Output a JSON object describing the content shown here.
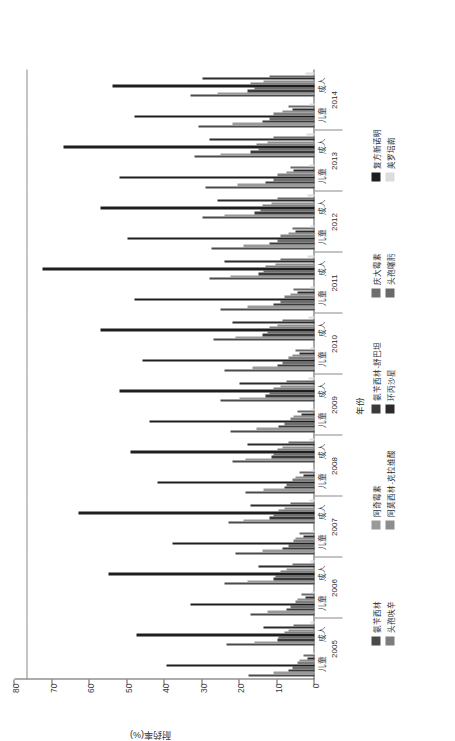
{
  "chart_data": {
    "type": "bar",
    "title": "",
    "orientation": "vertical-grouped",
    "xlabel": "年份",
    "ylabel": "耐药率(%)",
    "ylim": [
      0,
      80
    ],
    "yticks": [
      0,
      10,
      20,
      30,
      40,
      50,
      60,
      70,
      80
    ],
    "ytick_labels": [
      "0",
      "10",
      "20",
      "30",
      "40",
      "50",
      "60",
      "70",
      "80"
    ],
    "grid": false,
    "legend_position": "bottom",
    "categories": [
      "2005 儿童",
      "2005 成人",
      "2006 儿童",
      "2006 成人",
      "2007 儿童",
      "2007 成人",
      "2008 儿童",
      "2008 成人",
      "2009 儿童",
      "2009 成人",
      "2010 儿童",
      "2010 成人",
      "2011 儿童",
      "2011 成人",
      "2012 儿童",
      "2012 成人",
      "2013 儿童",
      "2013 成人",
      "2014 儿童",
      "2014 成人"
    ],
    "years": [
      "2005",
      "2006",
      "2007",
      "2008",
      "2009",
      "2010",
      "2011",
      "2012",
      "2013",
      "2014"
    ],
    "subgroups": [
      "儿童",
      "成人"
    ],
    "series": [
      {
        "name": "氨苄西林",
        "color": "#4a4a4a",
        "values": [
          17.5,
          23.5,
          17.0,
          24.0,
          21.0,
          23.0,
          18.5,
          22.0,
          22.5,
          25.0,
          24.0,
          27.0,
          25.0,
          28.0,
          27.5,
          30.0,
          29.0,
          32.0,
          31.0,
          33.0
        ]
      },
      {
        "name": "阿奇霉素",
        "color": "#9a9a9a",
        "values": [
          11.0,
          16.0,
          12.5,
          18.0,
          14.0,
          19.0,
          13.5,
          18.5,
          15.5,
          20.0,
          16.5,
          21.0,
          18.0,
          22.5,
          19.0,
          24.0,
          20.5,
          25.0,
          22.0,
          26.0
        ]
      },
      {
        "name": "氨苄西林-舒巴坦",
        "color": "#3a3a3a",
        "values": [
          7.0,
          10.0,
          7.5,
          11.0,
          8.5,
          12.0,
          8.0,
          11.5,
          9.5,
          13.0,
          10.0,
          14.0,
          11.0,
          15.0,
          12.0,
          16.0,
          13.0,
          17.0,
          14.0,
          18.0
        ]
      },
      {
        "name": "庆大霉素",
        "color": "#6e6e6e",
        "values": [
          6.0,
          9.5,
          6.5,
          10.5,
          7.0,
          11.0,
          7.5,
          11.0,
          8.0,
          12.0,
          8.5,
          12.5,
          9.0,
          13.5,
          10.0,
          14.5,
          11.0,
          15.0,
          12.0,
          16.0
        ]
      },
      {
        "name": "复方新诺明",
        "color": "#1e1e1e",
        "values": [
          39.5,
          47.5,
          33.0,
          55.0,
          38.0,
          63.0,
          42.0,
          49.0,
          44.0,
          52.0,
          46.0,
          57.0,
          48.0,
          72.5,
          50.0,
          57.0,
          52.0,
          67.0,
          48.0,
          54.0
        ]
      },
      {
        "name": "头孢呋辛",
        "color": "#7d7d7d",
        "values": [
          4.5,
          8.0,
          5.0,
          9.0,
          5.5,
          9.5,
          6.0,
          10.0,
          6.5,
          11.0,
          7.0,
          12.0,
          8.0,
          13.0,
          9.0,
          14.0,
          10.0,
          15.5,
          11.0,
          17.0
        ]
      },
      {
        "name": "阿莫西林-克拉维酸",
        "color": "#8d8d8d",
        "values": [
          4.0,
          7.0,
          4.5,
          7.5,
          5.0,
          8.0,
          5.0,
          8.5,
          5.5,
          9.0,
          6.0,
          10.0,
          6.5,
          10.5,
          7.0,
          11.5,
          7.5,
          12.5,
          8.5,
          13.5
        ]
      },
      {
        "name": "环丙沙星",
        "color": "#2b2b2b",
        "values": [
          2.0,
          13.5,
          2.5,
          15.0,
          3.0,
          17.0,
          3.0,
          18.0,
          3.5,
          20.0,
          4.0,
          22.0,
          4.5,
          24.0,
          5.0,
          26.0,
          5.5,
          28.0,
          6.0,
          30.0
        ]
      },
      {
        "name": "头孢噻肟",
        "color": "#6a6a6a",
        "values": [
          3.0,
          5.5,
          3.5,
          6.0,
          4.0,
          6.5,
          4.0,
          7.0,
          4.5,
          7.5,
          5.0,
          8.5,
          5.5,
          9.0,
          6.0,
          10.0,
          6.5,
          11.0,
          7.0,
          12.0
        ]
      },
      {
        "name": "美罗培南",
        "color": "#dcdcdc",
        "values": [
          0.6,
          1.0,
          0.7,
          1.2,
          0.8,
          1.3,
          0.8,
          1.4,
          0.9,
          1.5,
          1.0,
          1.7,
          1.1,
          1.8,
          1.2,
          2.0,
          1.3,
          2.2,
          1.4,
          2.4
        ]
      }
    ]
  },
  "axes": {
    "y_title": "耐药率(%)",
    "x_title": "年份"
  }
}
